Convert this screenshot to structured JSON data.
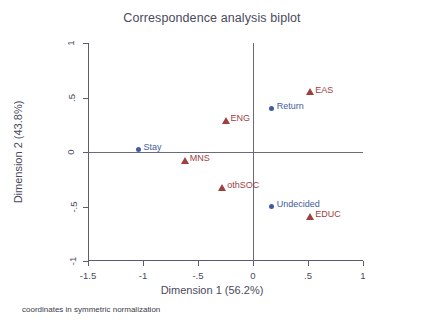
{
  "chart_data": {
    "type": "scatter",
    "title": "Correspondence analysis biplot",
    "xlabel": "Dimension 1 (56.2%)",
    "ylabel": "Dimension 2 (43.8%)",
    "footnote": "coordinates in symmetric normalization",
    "xlim": [
      -1.5,
      1
    ],
    "ylim": [
      -1,
      1
    ],
    "grid": false,
    "legend": "none",
    "zero_reference_lines": true,
    "xticks": [
      {
        "value": -1.5,
        "label": "-1.5"
      },
      {
        "value": -1,
        "label": "-1"
      },
      {
        "value": -0.5,
        "label": "-.5"
      },
      {
        "value": 0,
        "label": "0"
      },
      {
        "value": 0.5,
        "label": ".5"
      },
      {
        "value": 1,
        "label": "1"
      }
    ],
    "yticks": [
      {
        "value": 1,
        "label": "1"
      },
      {
        "value": 0.5,
        "label": ".5"
      },
      {
        "value": 0,
        "label": "0"
      },
      {
        "value": -0.5,
        "label": "-.5"
      },
      {
        "value": -1,
        "label": "-1"
      }
    ],
    "colors": {
      "row_points": "#3f5d9e",
      "column_points": "#9e3f40",
      "axis": "#5c5c6e",
      "text": "#4a4a5e"
    },
    "series": [
      {
        "name": "row categories",
        "marker": "circle",
        "color": "#3f5d9e",
        "points": [
          {
            "label": "Stay",
            "x": -1.04,
            "y": 0.02
          },
          {
            "label": "Return",
            "x": 0.17,
            "y": 0.4
          },
          {
            "label": "Undecided",
            "x": 0.17,
            "y": -0.5
          }
        ]
      },
      {
        "name": "column categories",
        "marker": "triangle",
        "color": "#9e3f40",
        "points": [
          {
            "label": "EAS",
            "x": 0.52,
            "y": 0.55
          },
          {
            "label": "ENG",
            "x": -0.25,
            "y": 0.29
          },
          {
            "label": "MNS",
            "x": -0.62,
            "y": -0.08
          },
          {
            "label": "othSOC",
            "x": -0.28,
            "y": -0.33
          },
          {
            "label": "EDUC",
            "x": 0.52,
            "y": -0.59
          }
        ]
      }
    ]
  }
}
